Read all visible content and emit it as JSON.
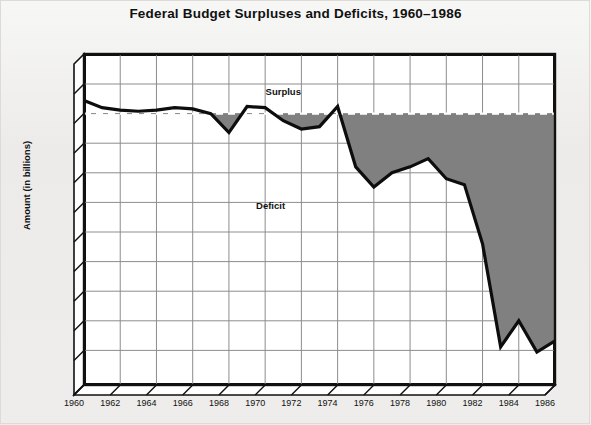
{
  "title": "Federal Budget Surpluses and Deficits, 1960–1986",
  "axis": {
    "y_title": "Amount (in billions)",
    "x_title": ""
  },
  "annotations": [
    {
      "name": "surplus-label",
      "text": "Surplus",
      "x": 1971.0,
      "y": 19
    },
    {
      "name": "deficit-label",
      "text": "Deficit",
      "x": 1970.3,
      "y": -77
    }
  ],
  "chart_data": {
    "type": "area",
    "title": "Federal Budget Surpluses and Deficits, 1960–1986",
    "xlabel": "",
    "ylabel": "Amount (in billions)",
    "units": "billions of dollars",
    "grid": true,
    "legend": false,
    "zero_reference_line": true,
    "broken_axis": true,
    "ylim": [
      -300,
      37
    ],
    "xlim": [
      1960,
      1986
    ],
    "y_ticks": [
      25,
      0,
      -25,
      -50,
      -75,
      -100,
      -125,
      -150,
      -175,
      -200,
      -300
    ],
    "y_tick_labels": [
      "$ 25",
      "0",
      "− $ 25",
      "− $ 50",
      "− $ 75",
      "−$100",
      "−$125",
      "−$150",
      "−$175",
      "−$200",
      "−$300"
    ],
    "x_ticks": [
      1960,
      1962,
      1964,
      1966,
      1968,
      1970,
      1972,
      1974,
      1976,
      1978,
      1980,
      1982,
      1984,
      1986
    ],
    "x_tick_labels": [
      "1960",
      "1962",
      "1964",
      "1966",
      "1968",
      "1970",
      "1972",
      "1974",
      "1976",
      "1978",
      "1980",
      "1982",
      "1984",
      "1986"
    ],
    "series": [
      {
        "name": "Federal budget surplus/deficit",
        "x": [
          1960,
          1961,
          1962,
          1963,
          1964,
          1965,
          1966,
          1967,
          1968,
          1969,
          1970,
          1971,
          1972,
          1973,
          1974,
          1975,
          1976,
          1977,
          1978,
          1979,
          1980,
          1981,
          1982,
          1983,
          1984,
          1985,
          1986
        ],
        "values": [
          11,
          5,
          3,
          2,
          3,
          5,
          4,
          0,
          -16,
          6,
          5,
          -6,
          -13,
          -11,
          6,
          -45,
          -62,
          -50,
          -45,
          -38,
          -55,
          -60,
          -110,
          -197,
          -175,
          -205,
          -192
        ]
      }
    ],
    "fill": {
      "below_zero_color": "#808080",
      "above_zero_color": "#ffffff"
    },
    "line_color": "#0d0d0d",
    "plot_background": "#ffffff",
    "page_background": "#eeedeb"
  }
}
